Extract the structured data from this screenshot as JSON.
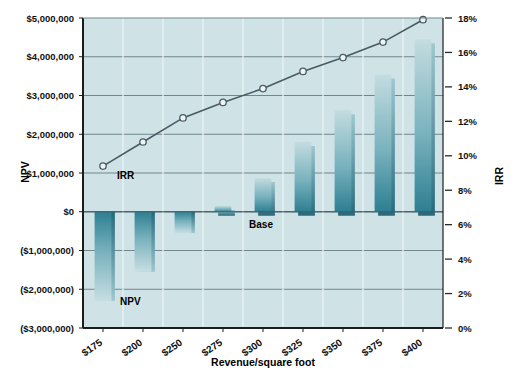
{
  "chart_data": {
    "type": "bar",
    "title": "",
    "xlabel": "Revenue/square foot",
    "ylabel": "NPV",
    "ylabel_right": "IRR",
    "categories": [
      "$175",
      "$200",
      "$250",
      "$275",
      "$300",
      "$325",
      "$350",
      "$375",
      "$400"
    ],
    "series": [
      {
        "name": "NPV",
        "type": "bar",
        "axis": "left",
        "values": [
          -2300000,
          -1550000,
          -550000,
          150000,
          870000,
          1800000,
          2620000,
          3540000,
          4450000
        ]
      },
      {
        "name": "IRR",
        "type": "line",
        "axis": "right",
        "values": [
          0.094,
          0.108,
          0.122,
          0.131,
          0.139,
          0.149,
          0.157,
          0.166,
          0.179
        ]
      }
    ],
    "ylim": [
      -3000000,
      5000000
    ],
    "yticks": [
      5000000,
      4000000,
      3000000,
      2000000,
      1000000,
      0,
      -1000000,
      -2000000,
      -3000000
    ],
    "ytick_labels": [
      "$5,000,000",
      "$4,000,000",
      "$3,000,000",
      "$2,000,000",
      "$1,000,000",
      "$0",
      "($1,000,000)",
      "($2,000,000)",
      "($3,000,000)"
    ],
    "ylim_right": [
      0,
      0.18
    ],
    "yticks_right": [
      0.18,
      0.16,
      0.14,
      0.12,
      0.1,
      0.08,
      0.06,
      0.04,
      0.02,
      0
    ],
    "ytick_labels_right": [
      "18%",
      "16%",
      "14%",
      "12%",
      "10%",
      "8%",
      "6%",
      "4%",
      "2%",
      "0%"
    ],
    "grid": true,
    "legend_position": "inline-annotations",
    "annotations": [
      {
        "name": "irr-label",
        "text": "IRR",
        "category": "$175"
      },
      {
        "name": "npv-label",
        "text": "NPV",
        "category": "$175"
      },
      {
        "name": "base-label",
        "text": "Base",
        "category": "$300"
      }
    ],
    "colors": {
      "plot_background": "#cfe3e6",
      "bar_top": "#bcd8dc",
      "bar_bottom": "#2d7f92",
      "bar_edge": "#2b7b8d",
      "line": "#4a5a63",
      "marker_fill": "#eef5f6",
      "grid": "#7f9499",
      "axis": "#1c1c1c",
      "text": "#111111"
    }
  }
}
